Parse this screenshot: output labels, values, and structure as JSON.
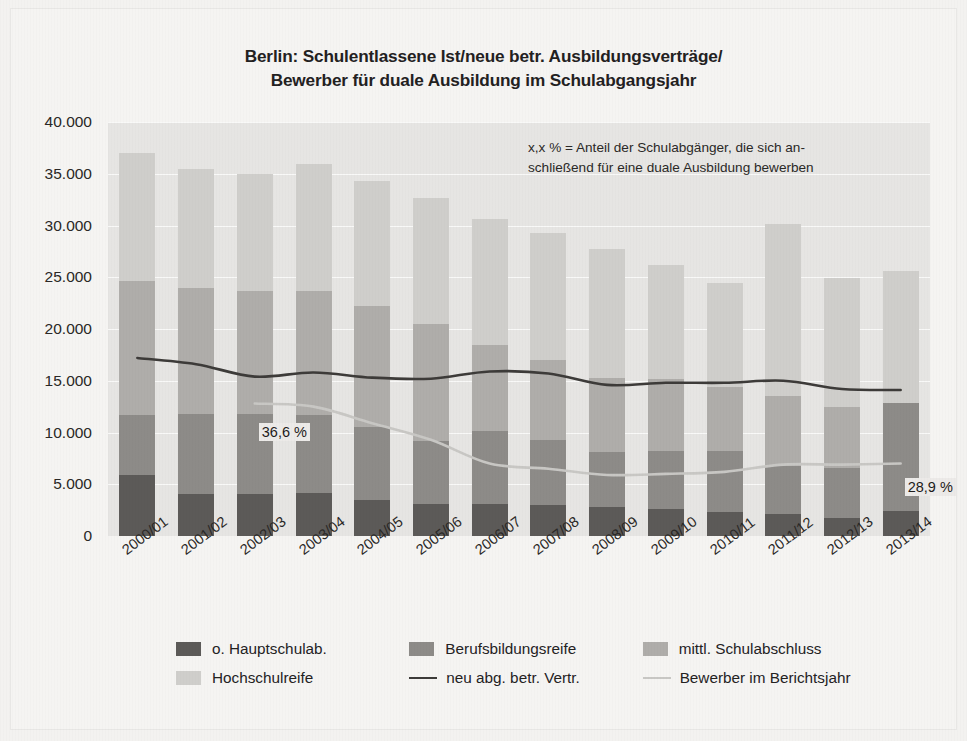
{
  "title": {
    "line1": "Berlin: Schulentlassene Ist/neue betr. Ausbildungsverträge/",
    "line2": "Bewerber für duale Ausbildung im Schulabgangsjahr"
  },
  "note": {
    "line1": "x,x % = Anteil der Schulabgänger, die sich an-",
    "line2": "schließend für eine duale Ausbildung bewerben"
  },
  "legend": {
    "items": [
      {
        "label": "o. Hauptschulab.",
        "type": "swatch",
        "color": "#5c5a58"
      },
      {
        "label": "Berufsbildungsreife",
        "type": "swatch",
        "color": "#8d8b88"
      },
      {
        "label": "mittl. Schulabschluss",
        "type": "swatch",
        "color": "#afadaa"
      },
      {
        "label": "Hochschulreife",
        "type": "swatch",
        "color": "#cfcecb"
      },
      {
        "label": "neu abg. betr. Vertr.",
        "type": "line",
        "color": "#3d3b39"
      },
      {
        "label": "Bewerber im Berichtsjahr",
        "type": "line",
        "color": "#c8c7c4"
      }
    ]
  },
  "chart_data": {
    "type": "bar",
    "subtype": "stacked-bar-with-lines",
    "title": "Berlin: Schulentlassene Ist/neue betr. Ausbildungsverträge/ Bewerber für duale Ausbildung im Schulabgangsjahr",
    "xlabel": "",
    "ylabel": "",
    "ylim": [
      0,
      40000
    ],
    "yticks": [
      0,
      5000,
      10000,
      15000,
      20000,
      25000,
      30000,
      35000,
      40000
    ],
    "ytick_labels": [
      "0",
      "5.000",
      "10.000",
      "15.000",
      "20.000",
      "25.000",
      "30.000",
      "35.000",
      "40.000"
    ],
    "grid": true,
    "legend_position": "bottom",
    "categories": [
      "2000/01",
      "2001/02",
      "2002/03",
      "2003/04",
      "2004/05",
      "2005/06",
      "2006/07",
      "2007/08",
      "2008/09",
      "2009/10",
      "2010/11",
      "2011/12",
      "2012/13",
      "2013/14"
    ],
    "series": [
      {
        "name": "o. Hauptschulab.",
        "color": "#5c5a58",
        "stack": "schulentlassene",
        "values": [
          5900,
          4100,
          4100,
          4200,
          3500,
          3100,
          3100,
          3000,
          2800,
          2600,
          2300,
          2100,
          1700,
          2400
        ]
      },
      {
        "name": "Berufsbildungsreife",
        "color": "#8d8b88",
        "stack": "schulentlassene",
        "values": [
          5800,
          7700,
          7700,
          7500,
          7000,
          6100,
          7000,
          6300,
          5300,
          5600,
          5900,
          4700,
          4900,
          10500
        ]
      },
      {
        "name": "mittl. Schulabschluss",
        "color": "#afadaa",
        "stack": "schulentlassene",
        "values": [
          12900,
          12200,
          11900,
          12000,
          11700,
          11300,
          8400,
          7700,
          7200,
          7000,
          6200,
          6700,
          5900,
          0
        ]
      },
      {
        "name": "Hochschulreife",
        "color": "#cfcecb",
        "stack": "schulentlassene",
        "values": [
          12400,
          11500,
          11300,
          12200,
          12100,
          12200,
          12100,
          12300,
          12400,
          11000,
          10000,
          16600,
          12400,
          12700
        ]
      }
    ],
    "lines": [
      {
        "name": "neu abg. betr. Vertr.",
        "color": "#3d3b39",
        "values": [
          17200,
          16600,
          15400,
          15800,
          15300,
          15200,
          15900,
          15700,
          14600,
          14800,
          14800,
          15000,
          14200,
          14100
        ]
      },
      {
        "name": "Bewerber im Berichtsjahr",
        "color": "#c8c7c4",
        "values": [
          null,
          null,
          12800,
          12500,
          10900,
          9300,
          7000,
          6500,
          5900,
          6000,
          6200,
          6900,
          6900,
          7000
        ]
      }
    ],
    "annotations": [
      {
        "text": "36,6 %",
        "category": "2002/03",
        "value": 10000
      },
      {
        "text": "28,9 %",
        "category": "2013/14",
        "value": 4600
      }
    ]
  }
}
